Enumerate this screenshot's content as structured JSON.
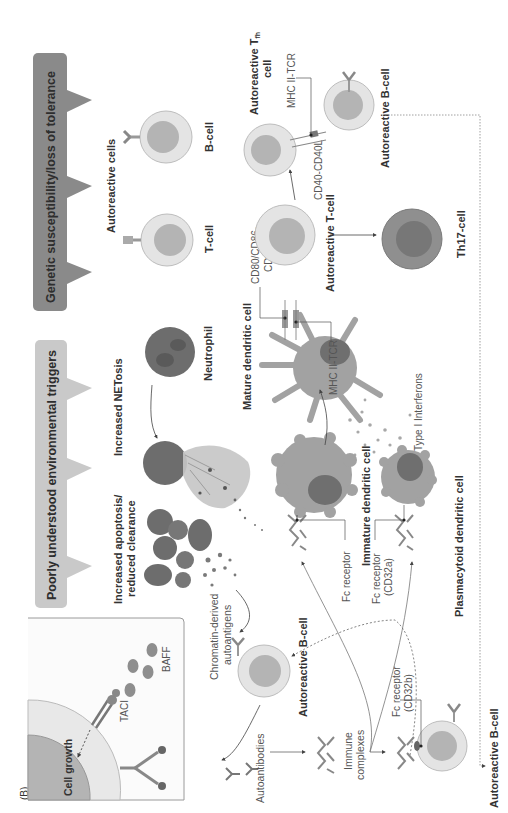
{
  "figure": {
    "panel_label": "(B)",
    "orientation": "rotated 90 degrees counter-clockwise",
    "colors": {
      "banner_dark": "#8a8a8a",
      "banner_light": "#c9c9c9",
      "cell_outer": "#e4e4e4",
      "cell_nucleus": "#b4b4b4",
      "dendritic_body": "#a2a2a2",
      "dendritic_nucleus": "#6f6f6f",
      "neutrophil": "#6d6d6d",
      "th17_outer": "#8f8f8f",
      "th17_nucleus": "#777777",
      "inset_border": "#9a9a9a"
    }
  },
  "banners": {
    "genetic": "Genetic susceptibility/loss of tolerance",
    "environmental": "Poorly understood environmental triggers"
  },
  "labels": {
    "autoreactive_cells": "Autoreactive cells",
    "t_cell": "T-cell",
    "b_cell": "B-cell",
    "increased_netosis": "Increased NETosis",
    "neutrophil": "Neutrophil",
    "increased_apoptosis_1": "Increased apoptosis/",
    "increased_apoptosis_2": "reduced clearance",
    "mature_dc": "Mature dendritic cell",
    "immature_dc": "Immature dendritic cell",
    "plasmacytoid_dc": "Plasmacytoid dendritic cell",
    "type1_ifn": "Type I Interferons",
    "mhc_tcr_1": "MHC II-TCR",
    "mhc_tcr_2": "MHC II-TCR",
    "cd80_1": "CD80/CD86-",
    "cd80_2": "CD28",
    "cd40": "CD40-CD40L",
    "autoreactive_t_cell": "Autoreactive T-cell",
    "autoreactive_tfh_1": "Autoreactive T",
    "autoreactive_tfh_sub": "fh",
    "autoreactive_tfh_2": "cell",
    "autoreactive_b_cell_top": "Autoreactive B-cell",
    "autoreactive_b_cell_mid": "Autoreactive B-cell",
    "autoreactive_b_cell_bottom": "Autoreactive B-cell",
    "th17": "Th17-cell",
    "fc_receptor": "Fc receptor",
    "fc_cd32a_1": "Fc receptor",
    "fc_cd32a_2": "(CD32a)",
    "fc_cd32b_1": "Fc receptor",
    "fc_cd32b_2": "(CD32b)",
    "chromatin_1": "Chromatin-derived",
    "chromatin_2": "autoantigens",
    "autoantibodies": "Autoantibodies",
    "immune_1": "Immune",
    "immune_2": "complexes"
  },
  "inset": {
    "cell_growth": "Cell growth",
    "taci": "TACI",
    "baff": "BAFF"
  }
}
